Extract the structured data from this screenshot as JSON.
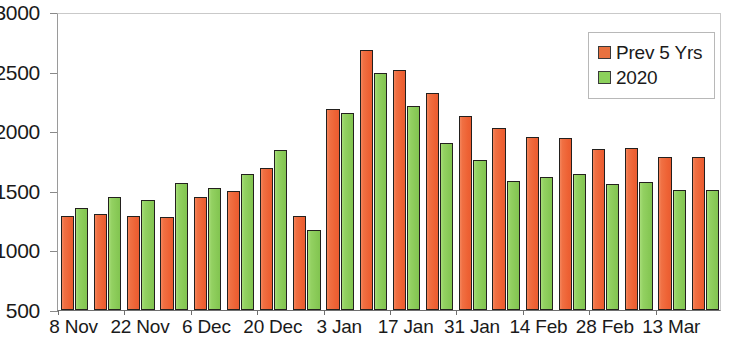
{
  "chart_data": {
    "type": "bar",
    "title": "",
    "xlabel": "",
    "ylabel": "",
    "ylim": [
      500,
      3000
    ],
    "yticks": [
      500,
      1000,
      1500,
      2000,
      2500,
      3000
    ],
    "ytick_labels": [
      "500",
      "1000",
      "1500",
      "2000",
      "2500",
      "3000"
    ],
    "grid": false,
    "legend_position": "top-right",
    "categories": [
      "8 Nov",
      "15 Nov",
      "22 Nov",
      "29 Nov",
      "6 Dec",
      "13 Dec",
      "20 Dec",
      "27 Dec",
      "3 Jan",
      "10 Jan",
      "17 Jan",
      "24 Jan",
      "31 Jan",
      "7 Feb",
      "14 Feb",
      "21 Feb",
      "28 Feb",
      "7 Mar",
      "13 Mar",
      "20 Mar"
    ],
    "xtick_labels": [
      "8 Nov",
      "22 Nov",
      "6 Dec",
      "20 Dec",
      "3 Jan",
      "17 Jan",
      "31 Jan",
      "14 Feb",
      "28 Feb",
      "13 Mar"
    ],
    "xtick_indices": [
      0,
      2,
      4,
      6,
      8,
      10,
      12,
      14,
      16,
      18
    ],
    "series": [
      {
        "name": "Prev 5 Yrs",
        "color": "#ee6b3f",
        "values": [
          1290,
          1305,
          1285,
          1280,
          1450,
          1500,
          1690,
          1285,
          2190,
          2680,
          2510,
          2320,
          2130,
          2030,
          1950,
          1940,
          1850,
          1855,
          1780,
          1780
        ]
      },
      {
        "name": "2020",
        "color": "#8fd05f",
        "values": [
          1360,
          1450,
          1425,
          1565,
          1520,
          1640,
          1845,
          1175,
          2150,
          2490,
          2210,
          1905,
          1760,
          1580,
          1620,
          1640,
          1560,
          1575,
          1510,
          1510
        ]
      }
    ]
  },
  "legend": {
    "items": [
      {
        "label": "Prev 5 Yrs",
        "color": "#e8713f"
      },
      {
        "label": "2020",
        "color": "#8cd15c"
      }
    ]
  }
}
